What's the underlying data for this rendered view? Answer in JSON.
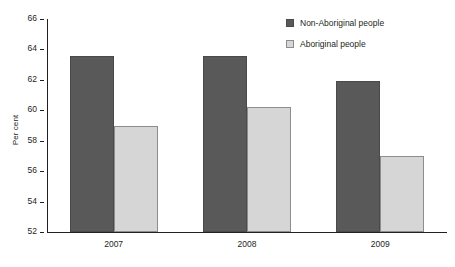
{
  "chart_data": {
    "type": "bar",
    "title": "",
    "subtitle": "",
    "xlabel": "",
    "ylabel": "Per cent",
    "categories": [
      "2007",
      "2008",
      "2009"
    ],
    "series": [
      {
        "name": "Non-Aboriginal people",
        "color": "#595959",
        "values": [
          63.6,
          63.6,
          61.9
        ]
      },
      {
        "name": "Aboriginal people",
        "color": "#d6d6d6",
        "values": [
          59.0,
          60.2,
          57.0
        ]
      }
    ],
    "ylim": [
      52,
      66
    ],
    "ytick_step": 2,
    "yticks": [
      52,
      54,
      56,
      58,
      60,
      62,
      64,
      66
    ],
    "ytick_labels": [
      "52",
      "54",
      "56",
      "58",
      "60",
      "62",
      "64",
      "66"
    ],
    "grid": false,
    "legend_position": "top-right",
    "annotations": []
  },
  "legend": {
    "items": [
      {
        "label": "Non-Aboriginal people",
        "swatch": "legend-swatch-dark"
      },
      {
        "label": "Aboriginal people",
        "swatch": "legend-swatch-light"
      }
    ]
  },
  "axes": {
    "y_title": "Per cent"
  }
}
